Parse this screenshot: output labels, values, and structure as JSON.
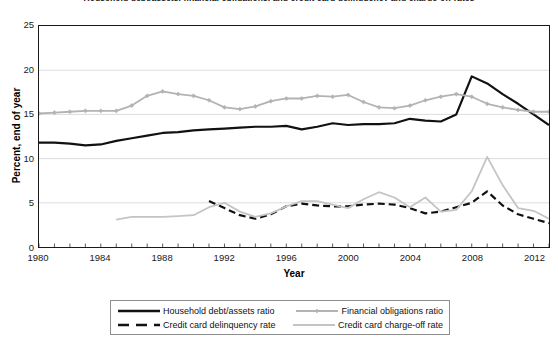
{
  "chart_data": {
    "type": "line",
    "title": "Household debt/assets, financial obligations, and credit card delinquency and charge-off rates",
    "xlabel": "Year",
    "ylabel": "Percent, end of year",
    "xlim": [
      1980,
      2013
    ],
    "ylim": [
      0,
      25
    ],
    "ytick_values": [
      0,
      5,
      10,
      15,
      20,
      25
    ],
    "ytick_labels": [
      "0",
      "5",
      "10",
      "15",
      "20",
      "25"
    ],
    "xtick_values": [
      1980,
      1984,
      1988,
      1992,
      1996,
      2000,
      2004,
      2008,
      2012
    ],
    "xtick_labels": [
      "1980",
      "1984",
      "1988",
      "1992",
      "1996",
      "2000",
      "2004",
      "2008",
      "2012"
    ],
    "grid": "horizontal",
    "legend_position": "bottom",
    "series": [
      {
        "name": "Household debt/assets ratio",
        "color": "#111111",
        "style": "solid",
        "width": 2.2,
        "marker": "none",
        "x": [
          1980,
          1981,
          1982,
          1983,
          1984,
          1985,
          1986,
          1987,
          1988,
          1989,
          1990,
          1991,
          1992,
          1993,
          1994,
          1995,
          1996,
          1997,
          1998,
          1999,
          2000,
          2001,
          2002,
          2003,
          2004,
          2005,
          2006,
          2007,
          2008,
          2009,
          2010,
          2011,
          2012,
          2013
        ],
        "y": [
          11.8,
          11.8,
          11.7,
          11.5,
          11.6,
          12.0,
          12.3,
          12.6,
          12.9,
          13.0,
          13.2,
          13.3,
          13.4,
          13.5,
          13.6,
          13.6,
          13.7,
          13.3,
          13.6,
          14.0,
          13.8,
          13.9,
          13.9,
          14.0,
          14.5,
          14.3,
          14.2,
          15.0,
          19.3,
          18.5,
          17.3,
          16.2,
          15.0,
          13.8
        ]
      },
      {
        "name": "Financial obligations ratio",
        "color": "#b3b3b3",
        "style": "solid",
        "width": 1.8,
        "marker": "diamond",
        "x": [
          1980,
          1981,
          1982,
          1983,
          1984,
          1985,
          1986,
          1987,
          1988,
          1989,
          1990,
          1991,
          1992,
          1993,
          1994,
          1995,
          1996,
          1997,
          1998,
          1999,
          2000,
          2001,
          2002,
          2003,
          2004,
          2005,
          2006,
          2007,
          2008,
          2009,
          2010,
          2011,
          2012,
          2013
        ],
        "y": [
          15.1,
          15.2,
          15.3,
          15.4,
          15.4,
          15.4,
          16.0,
          17.1,
          17.6,
          17.3,
          17.1,
          16.6,
          15.8,
          15.6,
          15.9,
          16.5,
          16.8,
          16.8,
          17.1,
          17.0,
          17.2,
          16.4,
          15.8,
          15.7,
          16.0,
          16.6,
          17.0,
          17.3,
          17.0,
          16.2,
          15.8,
          15.5,
          15.3,
          15.3
        ]
      },
      {
        "name": "Credit card delinquency rate",
        "color": "#111111",
        "style": "dashed",
        "width": 2.2,
        "marker": "none",
        "x": [
          1991,
          1992,
          1993,
          1994,
          1995,
          1996,
          1997,
          1998,
          1999,
          2000,
          2001,
          2002,
          2003,
          2004,
          2005,
          2006,
          2007,
          2008,
          2009,
          2010,
          2011,
          2012,
          2013
        ],
        "y": [
          5.2,
          4.4,
          3.6,
          3.2,
          3.7,
          4.6,
          4.9,
          4.7,
          4.6,
          4.6,
          4.8,
          4.9,
          4.8,
          4.4,
          3.8,
          4.0,
          4.5,
          5.0,
          6.3,
          4.7,
          3.7,
          3.2,
          2.7
        ]
      },
      {
        "name": "Credit card charge-off rate",
        "color": "#c4c4c4",
        "style": "solid",
        "width": 1.8,
        "marker": "none",
        "x": [
          1985,
          1986,
          1987,
          1988,
          1989,
          1990,
          1991,
          1992,
          1993,
          1994,
          1995,
          1996,
          1997,
          1998,
          1999,
          2000,
          2001,
          2002,
          2003,
          2004,
          2005,
          2006,
          2007,
          2008,
          2009,
          2010,
          2011,
          2012,
          2013
        ],
        "y": [
          3.1,
          3.4,
          3.4,
          3.4,
          3.5,
          3.6,
          4.5,
          5.0,
          4.0,
          3.4,
          3.8,
          4.6,
          5.2,
          5.2,
          4.8,
          4.4,
          5.4,
          6.2,
          5.6,
          4.5,
          5.6,
          4.0,
          4.2,
          6.3,
          10.2,
          7.0,
          4.4,
          4.1,
          3.2
        ]
      }
    ]
  },
  "legend": {
    "items": [
      {
        "label": "Household debt/assets ratio",
        "style": "solid-black"
      },
      {
        "label": "Financial obligations ratio",
        "style": "solid-gray-diamond"
      },
      {
        "label": "Credit card delinquency rate",
        "style": "dashed-black"
      },
      {
        "label": "Credit card charge-off rate",
        "style": "solid-lightgray"
      }
    ]
  }
}
